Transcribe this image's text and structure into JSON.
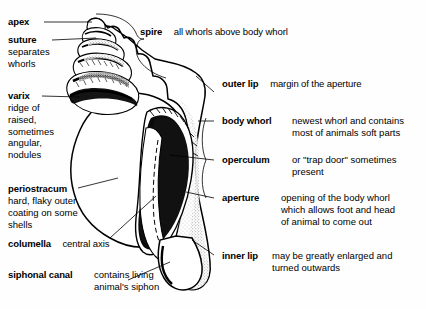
{
  "figure": {
    "background_color": "#fefefe",
    "ink_color": "#000000"
  },
  "labels": {
    "apex": {
      "term": "apex",
      "desc": ""
    },
    "suture": {
      "term": "suture",
      "desc_lines": [
        "separates",
        "whorls"
      ]
    },
    "varix": {
      "term": "varix",
      "desc_lines": [
        "ridge of",
        "raised,",
        "sometimes",
        "angular,",
        "nodules"
      ]
    },
    "periostracum": {
      "term": "periostracum",
      "desc_lines": [
        "hard, flaky outer",
        "coating on some",
        "shells"
      ]
    },
    "columella": {
      "term": "columella",
      "desc": "central axis"
    },
    "siphonal_canal": {
      "term": "siphonal canal",
      "desc_lines": [
        "contains living",
        "animal's siphon"
      ]
    },
    "spire": {
      "term": "spire",
      "desc": "all whorls above body whorl"
    },
    "outer_lip": {
      "term": "outer lip",
      "desc": "margin of the aperture"
    },
    "body_whorl": {
      "term": "body whorl",
      "desc_lines": [
        "newest whorl and contains",
        "most of animals soft parts"
      ]
    },
    "operculum": {
      "term": "operculum",
      "desc_lines": [
        "or \"trap door\" sometimes",
        "present"
      ]
    },
    "aperture": {
      "term": "aperture",
      "desc_lines": [
        "opening of the body whorl",
        "which allows foot and head",
        "of animal to come out"
      ]
    },
    "inner_lip": {
      "term": "inner lip",
      "desc_lines": [
        "may be greatly enlarged and",
        "turned outwards"
      ]
    }
  }
}
